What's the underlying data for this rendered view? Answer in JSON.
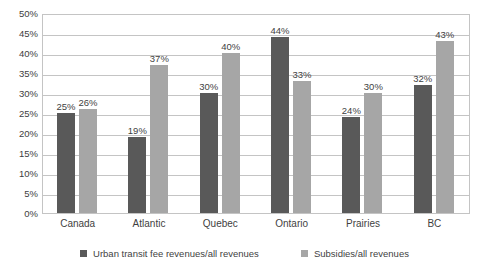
{
  "chart_data": {
    "type": "bar",
    "title": "",
    "subtitle": "",
    "xlabel": "",
    "ylabel": "",
    "ylim": [
      0,
      50
    ],
    "y_tick_step": 5,
    "y_tick_labels": [
      "50%",
      "45%",
      "40%",
      "35%",
      "30%",
      "25%",
      "20%",
      "15%",
      "10%",
      "5%",
      "0%"
    ],
    "y_tick_values": [
      50,
      45,
      40,
      35,
      30,
      25,
      20,
      15,
      10,
      5,
      0
    ],
    "grid": true,
    "grid_orientation": "horizontal",
    "legend_position": "bottom",
    "value_labels": true,
    "value_label_suffix": "%",
    "categories": [
      "Canada",
      "Atlantic",
      "Quebec",
      "Ontario",
      "Prairies",
      "BC"
    ],
    "series": [
      {
        "name": "Urban transit fee revenues/all revenues",
        "color": "#595959",
        "values": [
          25,
          19,
          30,
          44,
          24,
          32
        ],
        "labels": [
          "25%",
          "19%",
          "30%",
          "44%",
          "24%",
          "32%"
        ]
      },
      {
        "name": "Subsidies/all revenues",
        "color": "#a6a6a6",
        "values": [
          26,
          37,
          40,
          33,
          30,
          43
        ],
        "labels": [
          "26%",
          "37%",
          "40%",
          "33%",
          "30%",
          "43%"
        ]
      }
    ]
  },
  "colors": {
    "series0": "#595959",
    "series1": "#a6a6a6",
    "gridline": "#c4c4c4",
    "plot_border": "#c4c4c4",
    "text": "#3f3f3f",
    "background": "#ffffff"
  }
}
